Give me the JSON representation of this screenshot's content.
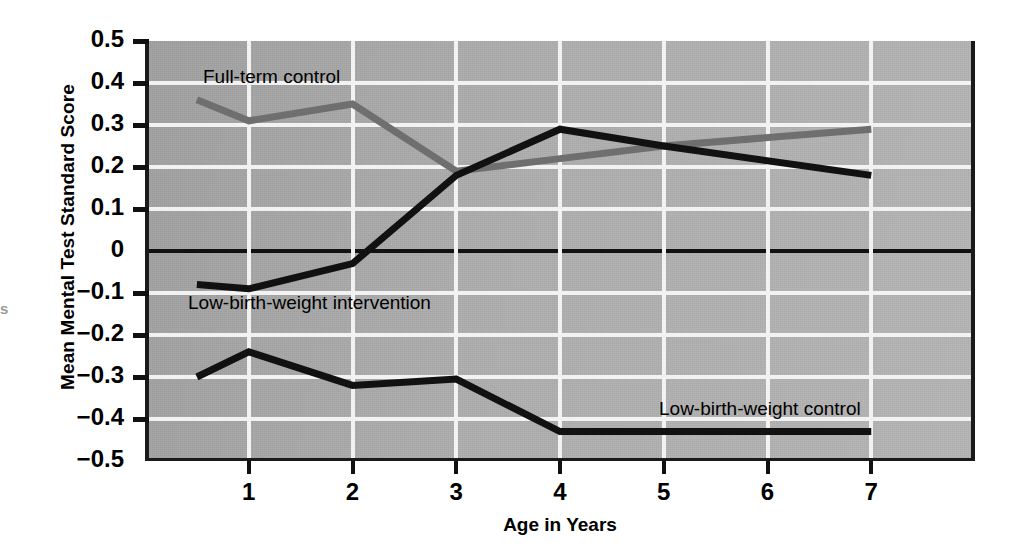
{
  "chart_data": {
    "type": "line",
    "title": "",
    "xlabel": "Age in Years",
    "ylabel": "Mean Mental Test Standard Score",
    "xlim": [
      0,
      8
    ],
    "ylim": [
      -0.5,
      0.5
    ],
    "xticks": [
      1,
      2,
      3,
      4,
      5,
      6,
      7
    ],
    "xticklabels": [
      "1",
      "2",
      "3",
      "4",
      "5",
      "6",
      "7"
    ],
    "yticks": [
      0.5,
      0.4,
      0.3,
      0.2,
      0.1,
      0,
      -0.1,
      -0.2,
      -0.3,
      -0.4,
      -0.5
    ],
    "yticklabels": [
      "0.5",
      "0.4",
      "0.3",
      "0.2",
      "0.1",
      "0",
      "−0.1",
      "−0.2",
      "−0.3",
      "−0.4",
      "−0.5"
    ],
    "grid": true,
    "grid_color": "#f2f2f2",
    "plot_background": "#adadad",
    "zero_line": true,
    "legend": "inline-annotations",
    "series": [
      {
        "name": "Full-term control",
        "color": "#6f6f6f",
        "label_position": "upper-left",
        "x": [
          0.5,
          1,
          2,
          3,
          4,
          5,
          7
        ],
        "values": [
          0.36,
          0.31,
          0.35,
          0.19,
          0.22,
          0.25,
          0.29
        ]
      },
      {
        "name": "Low-birth-weight intervention",
        "color": "#111111",
        "label_position": "left-middle",
        "x": [
          0.5,
          1,
          2,
          3,
          4,
          5,
          7
        ],
        "values": [
          -0.08,
          -0.09,
          -0.03,
          0.18,
          0.29,
          0.25,
          0.18
        ]
      },
      {
        "name": "Low-birth-weight control",
        "color": "#111111",
        "label_position": "lower-right",
        "x": [
          0.5,
          1,
          2,
          3,
          4,
          5,
          7
        ],
        "values": [
          -0.3,
          -0.24,
          -0.32,
          -0.305,
          -0.43,
          -0.43,
          -0.43
        ]
      }
    ]
  },
  "axes": {
    "y_title": "Mean Mental Test Standard Score",
    "x_title": "Age in Years"
  },
  "annotations": {
    "fullterm": "Full-term control",
    "intervention": "Low-birth-weight intervention",
    "lbwcontrol": "Low-birth-weight control"
  },
  "edge_artifact": "s"
}
